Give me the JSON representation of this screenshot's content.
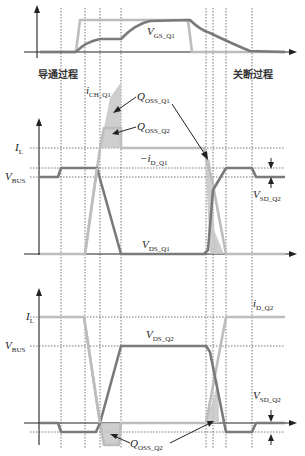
{
  "phases": {
    "turn_on": "导通过程",
    "turn_off": "关断过程"
  },
  "top_panel": {
    "signal": "V",
    "signal_sub": "GS_Q1"
  },
  "middle_panel": {
    "y_labels": [
      {
        "main": "I",
        "sub": "L"
      },
      {
        "main": "V",
        "sub": "BUS"
      }
    ],
    "i_ch": {
      "main": "i",
      "sub": "CH_Q1"
    },
    "q_oss_q1": {
      "main": "Q",
      "sub": "OSS_Q1"
    },
    "q_oss_q2": {
      "main": "Q",
      "sub": "OSS_Q2"
    },
    "i_d": {
      "main": "−i",
      "sub": "D_Q1"
    },
    "v_ds": {
      "main": "V",
      "sub": "DS_Q1"
    },
    "v_sd": {
      "main": "V",
      "sub": "SD_Q2"
    }
  },
  "bottom_panel": {
    "y_labels": [
      {
        "main": "I",
        "sub": "L"
      },
      {
        "main": "V",
        "sub": "BUS"
      }
    ],
    "i_d": {
      "main": "i",
      "sub": "D_Q2"
    },
    "v_ds": {
      "main": "V",
      "sub": "DS_Q2"
    },
    "v_sd": {
      "main": "V",
      "sub": "SD_Q2"
    },
    "q_oss": {
      "main": "Q",
      "sub": "OSS_Q2"
    }
  },
  "colors": {
    "dark_trace": "#7a7a7a",
    "light_trace": "#bdbdbd",
    "shade": "#c6c6c6",
    "axis": "#222222"
  }
}
